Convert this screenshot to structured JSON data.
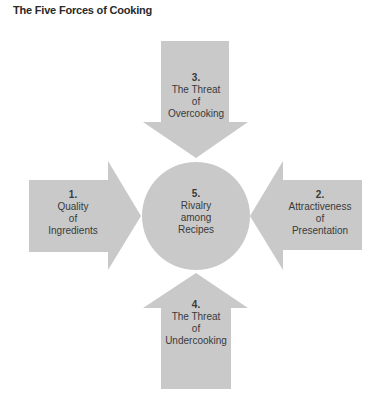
{
  "title": "The Five Forces of Cooking",
  "colors": {
    "shape_fill": "#c9c9c9",
    "text": "#3a3a3a",
    "background": "#ffffff"
  },
  "forces": {
    "top": {
      "number": "3.",
      "lines": [
        "The Threat",
        "of",
        "Overcooking"
      ]
    },
    "left": {
      "number": "1.",
      "lines": [
        "Quality",
        "of",
        "Ingredients"
      ]
    },
    "center": {
      "number": "5.",
      "lines": [
        "Rivalry",
        "among",
        "Recipes"
      ]
    },
    "right": {
      "number": "2.",
      "lines": [
        "Attractiveness",
        "of",
        "Presentation"
      ]
    },
    "bottom": {
      "number": "4.",
      "lines": [
        "The Threat",
        "of",
        "Undercooking"
      ]
    }
  }
}
